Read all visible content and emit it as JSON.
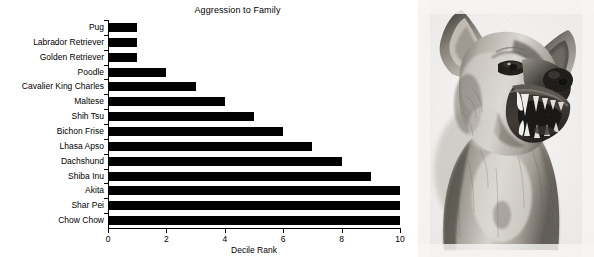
{
  "chart_data": {
    "type": "bar",
    "orientation": "horizontal",
    "title": "Aggression to Family",
    "xlabel": "Decile Rank",
    "ylabel": "",
    "xlim": [
      0,
      10
    ],
    "xticks": [
      0,
      2,
      4,
      6,
      8,
      10
    ],
    "grid": false,
    "legend": null,
    "bar_color": "#000000",
    "background_color": "#ffffff",
    "categories": [
      "Pug",
      "Labrador Retriever",
      "Golden Retriever",
      "Poodle",
      "Cavalier King Charles",
      "Maltese",
      "Shih Tsu",
      "Bichon Frise",
      "Lhasa Apso",
      "Dachshund",
      "Shiba Inu",
      "Akita",
      "Shar Pei",
      "Chow Chow"
    ],
    "values": [
      1,
      1,
      1,
      2,
      3,
      4,
      5,
      6,
      7,
      8,
      9,
      10,
      10,
      10
    ]
  },
  "photo": {
    "alt": "snarling-dog-illustration",
    "caption": ""
  }
}
